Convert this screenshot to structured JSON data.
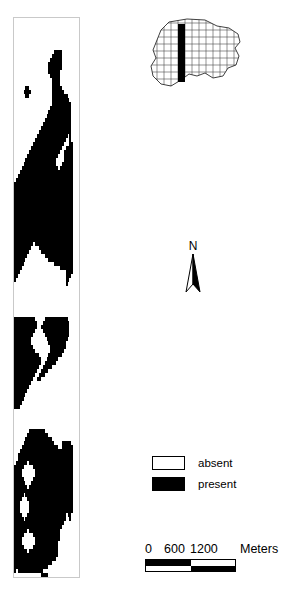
{
  "figure": {
    "type": "gis-map-figure",
    "background_color": "#ffffff",
    "ink_color": "#000000"
  },
  "raster_strip": {
    "name": "presence-absence-raster-strip",
    "border_color": "#c9c9c9",
    "absent_color": "#ffffff",
    "present_color": "#000000",
    "cols": 34,
    "rows": 140,
    "comment": "Row strings: '.' = absent (white), '#' = present (black)",
    "grid": [
      "..................................",
      "..................................",
      "..................................",
      "..................................",
      "..................................",
      "..................................",
      "..................................",
      "..................................",
      ".....................####.........",
      "....................#####.........",
      "...................######.........",
      "..................#######.........",
      "..................#######.........",
      "..................######..........",
      "...................#####..........",
      "....................####..........",
      "....................####..........",
      "......##............#####.........",
      ".....####...........######........",
      "......##............########......",
      "....................#########.....",
      "....................##########....",
      "...................###########....",
      "..................############....",
      ".................#############....",
      "................##############....",
      "...............###############....",
      "..............################....",
      ".............#################....",
      "............################.#....",
      "...........################..#....",
      "..........################...##...",
      ".........################..####...",
      "........################..#####...",
      ".......################...#####...",
      "......################....#####...",
      ".....#################...######...",
      "....###################.#######...",
      "...############################...",
      "..#############################...",
      ".##############################...",
      "###############################...",
      "###############################...",
      "###############################...",
      "###############################...",
      "###############################...",
      "###############################...",
      "###############################...",
      "###############################...",
      "###############################...",
      "###############################...",
      "###############################...",
      "###############################...",
      "###############################...",
      "###############################...",
      "###############################...",
      "##########.####################...",
      "#########....##################...",
      "########......#################...",
      "#######.........###############...",
      "######............#############...",
      "#####................##########...",
      "####....................#######...",
      "###........................####...",
      "##.........................###....",
      "#..........................##.....",
      "...........................#......",
      "..................................",
      "..................................",
      "..................................",
      "..................................",
      "..................................",
      "..................................",
      "..................................",
      "..................................",
      "###########.....############......",
      "############...##############.....",
      "############..###############.....",
      "###########....##############.....",
      "##########......#############.....",
      "#########........###########......",
      "#########.........#########.......",
      "##########.........########.......",
      "###########........#######........",
      "#############.....#######.........",
      "##############...######...........",
      "##############..######............",
      "#############..#####..............",
      "############..####................",
      "###########..###..................",
      "##########..##....................",
      "#########.........................",
      "########..........................",
      "#######...........................",
      "######............................",
      "#####.............................",
      "####..............................",
      "###...............................",
      "..................................",
      "..................................",
      "..................................",
      "..................................",
      "..................................",
      "........########..................",
      ".......###########................",
      "......##############..............",
      ".....################....#####....",
      "....###################..######...",
      "...############################...",
      "..#############################...",
      "..#############################...",
      ".######.#######################...",
      "#####.....#####################...",
      "####.......####################...",
      "####.......####################...",
      "#####.....#####################...",
      "######...######################...",
      "#######.#######################...",
      "###############################...",
      "#####.#########################...",
      "####...########################...",
      "###.....#######################...",
      "###.....#######################...",
      "###.....#######################...",
      "####...####################.##....",
      "#####.#####################..#....",
      "##########################........",
      "#########################.........",
      "#######.################..........",
      "#####.....##############..........",
      "####.......#############..........",
      "####.......############...........",
      "#####.....#############...........",
      "#######.###############...........",
      "#######################...........",
      "######################............",
      "####################..............",
      "##################................",
      "#.#############...................",
      "..............####................",
      "..................................",
      "..................................",
      "..................................",
      ".................................."
    ]
  },
  "inset_map": {
    "name": "locator-inset-map",
    "grid_line_color": "#555555",
    "boundary_color": "#333333",
    "study_area_color": "#000000",
    "cell_size": 7,
    "study_bar": {
      "x": 35,
      "y": 8,
      "width": 7,
      "height": 58
    }
  },
  "north_arrow": {
    "name": "north-arrow",
    "label": "N"
  },
  "legend": {
    "name": "map-legend",
    "items": [
      {
        "label": "absent",
        "swatch": "white",
        "color": "#ffffff"
      },
      {
        "label": "present",
        "swatch": "black",
        "color": "#000000"
      }
    ]
  },
  "scale_bar": {
    "name": "scale-bar",
    "ticks": [
      "0",
      "600",
      "1200"
    ],
    "units": "Meters",
    "segments": [
      "black",
      "white",
      "white",
      "black"
    ]
  }
}
